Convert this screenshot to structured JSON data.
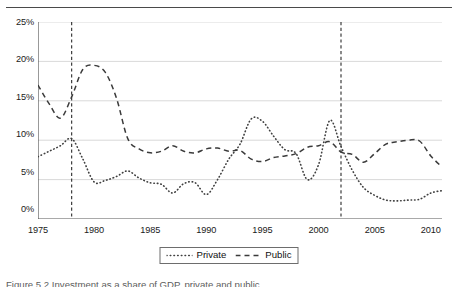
{
  "figure": {
    "caption_clipped": "Figure 5.2  Investment as a share of GDP, private and public"
  },
  "legend": {
    "position": "bottom-center",
    "entries": [
      {
        "label": "Private",
        "style": "dotted",
        "swatch": "dotted-line-swatch"
      },
      {
        "label": "Public",
        "style": "dashed",
        "swatch": "dashed-line-swatch"
      }
    ]
  },
  "axes": {
    "y_ticks": [
      "0%",
      "5%",
      "10%",
      "15%",
      "20%",
      "25%"
    ],
    "x_ticks": [
      "1975",
      "1980",
      "1985",
      "1990",
      "1995",
      "2000",
      "2005",
      "2010"
    ]
  },
  "chart_data": {
    "type": "line",
    "title": "",
    "subtitle": "",
    "xlabel": "",
    "ylabel": "",
    "xlim": [
      1975,
      2011
    ],
    "ylim": [
      0,
      25
    ],
    "y_unit": "percent",
    "grid": "horizontal",
    "legend_position": "bottom-center",
    "x": [
      1975,
      1976,
      1977,
      1978,
      1979,
      1980,
      1981,
      1982,
      1983,
      1984,
      1985,
      1986,
      1987,
      1988,
      1989,
      1990,
      1991,
      1992,
      1993,
      1994,
      1995,
      1996,
      1997,
      1998,
      1999,
      2000,
      2001,
      2002,
      2003,
      2004,
      2005,
      2006,
      2007,
      2008,
      2009,
      2010,
      2011
    ],
    "x_tick_labels": [
      "1975",
      "1980",
      "1985",
      "1990",
      "1995",
      "2000",
      "2005",
      "2010"
    ],
    "x_tick_values": [
      1975,
      1980,
      1985,
      1990,
      1995,
      2000,
      2005,
      2010
    ],
    "y_tick_labels": [
      "0%",
      "5%",
      "10%",
      "15%",
      "20%",
      "25%"
    ],
    "y_tick_values": [
      0,
      5,
      10,
      15,
      20,
      25
    ],
    "series": [
      {
        "name": "Private",
        "style": "dotted",
        "color": "#404040",
        "values": [
          7.9,
          8.6,
          9.3,
          10.2,
          7.6,
          4.7,
          4.9,
          5.4,
          6.1,
          5.2,
          4.6,
          4.4,
          3.3,
          4.5,
          4.6,
          3.1,
          5.0,
          7.6,
          9.5,
          12.7,
          12.4,
          10.5,
          8.8,
          8.3,
          5.0,
          6.9,
          12.5,
          9.2,
          6.2,
          4.0,
          3.0,
          2.4,
          2.3,
          2.4,
          2.5,
          3.3,
          3.6
        ]
      },
      {
        "name": "Public",
        "style": "dashed",
        "color": "#3a3a3a",
        "values": [
          17.0,
          14.6,
          12.8,
          15.5,
          19.0,
          19.5,
          18.6,
          15.3,
          10.2,
          8.9,
          8.4,
          8.6,
          9.3,
          8.6,
          8.4,
          8.9,
          9.0,
          8.6,
          8.7,
          7.6,
          7.3,
          7.8,
          8.0,
          8.3,
          9.1,
          9.3,
          9.8,
          8.5,
          8.2,
          7.2,
          8.3,
          9.5,
          9.8,
          10.0,
          9.9,
          8.0,
          6.6
        ]
      }
    ],
    "series_private_full": {
      "name": "Private",
      "points": [
        [
          1975,
          7.9
        ],
        [
          1976,
          8.6
        ],
        [
          1977,
          9.3
        ],
        [
          1978,
          10.2
        ],
        [
          1979,
          7.6
        ],
        [
          1980,
          4.7
        ],
        [
          1981,
          4.9
        ],
        [
          1982,
          5.4
        ],
        [
          1983,
          6.1
        ],
        [
          1984,
          5.2
        ],
        [
          1985,
          4.6
        ],
        [
          1986,
          4.4
        ],
        [
          1987,
          3.3
        ],
        [
          1988,
          4.5
        ],
        [
          1989,
          4.6
        ],
        [
          1990,
          3.1
        ],
        [
          1991,
          5.0
        ],
        [
          1992,
          7.6
        ],
        [
          1993,
          9.5
        ],
        [
          1994,
          12.7
        ],
        [
          1995,
          12.4
        ],
        [
          1996,
          10.5
        ],
        [
          1997,
          8.8
        ],
        [
          1998,
          8.3
        ],
        [
          1999,
          5.0
        ],
        [
          2000,
          6.9
        ],
        [
          2001,
          12.5
        ],
        [
          2002,
          9.2
        ],
        [
          2003,
          6.2
        ],
        [
          2004,
          4.0
        ],
        [
          2005,
          3.0
        ],
        [
          2006,
          2.4
        ],
        [
          2007,
          2.3
        ],
        [
          2008,
          2.4
        ],
        [
          2009,
          2.5
        ],
        [
          2010,
          3.3
        ],
        [
          2011,
          3.6
        ]
      ]
    },
    "series_public_full": {
      "name": "Public",
      "points": [
        [
          1975,
          17.0
        ],
        [
          1976,
          14.6
        ],
        [
          1977,
          12.8
        ],
        [
          1978,
          15.5
        ],
        [
          1979,
          19.0
        ],
        [
          1980,
          19.5
        ],
        [
          1981,
          18.6
        ],
        [
          1982,
          15.3
        ],
        [
          1983,
          10.2
        ],
        [
          1984,
          8.9
        ],
        [
          1985,
          8.4
        ],
        [
          1986,
          8.6
        ],
        [
          1987,
          9.3
        ],
        [
          1988,
          8.6
        ],
        [
          1989,
          8.4
        ],
        [
          1990,
          8.9
        ],
        [
          1991,
          9.0
        ],
        [
          1992,
          8.6
        ],
        [
          1993,
          8.7
        ],
        [
          1994,
          7.6
        ],
        [
          1995,
          7.3
        ],
        [
          1996,
          7.8
        ],
        [
          1997,
          8.0
        ],
        [
          1998,
          8.3
        ],
        [
          1999,
          9.1
        ],
        [
          2000,
          9.3
        ],
        [
          2001,
          9.8
        ],
        [
          2002,
          8.5
        ],
        [
          2003,
          8.2
        ],
        [
          2004,
          7.2
        ],
        [
          2005,
          8.3
        ],
        [
          2006,
          9.5
        ],
        [
          2007,
          9.8
        ],
        [
          2008,
          10.0
        ],
        [
          2009,
          9.9
        ],
        [
          2010,
          8.0
        ],
        [
          2011,
          6.6
        ]
      ]
    },
    "reference_lines": [
      {
        "name": "vertical-marker-1978",
        "x": 1978,
        "style": "dashed"
      },
      {
        "name": "vertical-marker-2002",
        "x": 2002,
        "style": "dashed"
      }
    ]
  }
}
